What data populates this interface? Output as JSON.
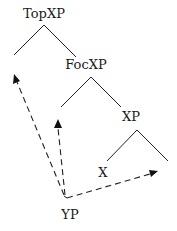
{
  "diagram": {
    "type": "syntax-tree",
    "nodes": [
      {
        "id": "topxp",
        "label": "TopXP"
      },
      {
        "id": "focxp",
        "label": "FocXP"
      },
      {
        "id": "xp",
        "label": "XP"
      },
      {
        "id": "x",
        "label": "X"
      },
      {
        "id": "yp",
        "label": "YP"
      }
    ],
    "movement_arrows": [
      {
        "from": "YP",
        "to": "TopXP specifier"
      },
      {
        "from": "YP",
        "to": "FocXP specifier"
      },
      {
        "from": "YP",
        "to": "XP complement"
      }
    ]
  }
}
